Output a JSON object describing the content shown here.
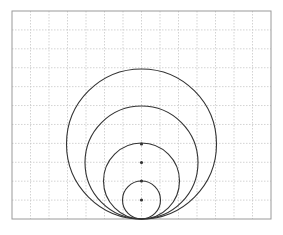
{
  "diagram": {
    "title": "",
    "frame": {
      "x": 12,
      "y": 11,
      "width": 259,
      "height": 208,
      "stroke": "#9a9a9a"
    },
    "grid": {
      "columns": 14,
      "rows": 11,
      "stroke": "#c8c8c8",
      "dash": "1.5,1.5"
    },
    "circles": [
      {
        "name": "circle-radius-4",
        "cx": 141.5,
        "cy": 144,
        "r": 75
      },
      {
        "name": "circle-radius-3",
        "cx": 141.5,
        "cy": 162.5,
        "r": 56.5
      },
      {
        "name": "circle-radius-2",
        "cx": 141.5,
        "cy": 181,
        "r": 38
      },
      {
        "name": "circle-radius-1",
        "cx": 141.5,
        "cy": 200,
        "r": 19
      }
    ],
    "center_dots": [
      {
        "cx": 141.5,
        "cy": 144
      },
      {
        "cx": 141.5,
        "cy": 162.5
      },
      {
        "cx": 141.5,
        "cy": 181
      },
      {
        "cx": 141.5,
        "cy": 200
      }
    ],
    "tangent_point": {
      "x": 141.5,
      "y": 219
    },
    "stroke_color": "#333333"
  }
}
